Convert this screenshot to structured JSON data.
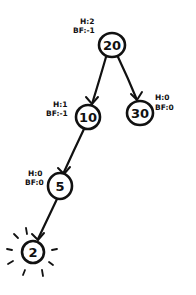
{
  "diagram": {
    "type": "avl-tree",
    "nodes": [
      {
        "id": "n20",
        "value": "20",
        "height_label": "H:2",
        "bf_label": "BF:-1"
      },
      {
        "id": "n10",
        "value": "10",
        "height_label": "H:1",
        "bf_label": "BF:-1"
      },
      {
        "id": "n30",
        "value": "30",
        "height_label": "H:0",
        "bf_label": "BF:0"
      },
      {
        "id": "n5",
        "value": "5",
        "height_label": "H:0",
        "bf_label": "BF:0"
      },
      {
        "id": "n2",
        "value": "2",
        "highlighted": true
      }
    ],
    "edges": [
      {
        "from": "20",
        "to": "10"
      },
      {
        "from": "20",
        "to": "30"
      },
      {
        "from": "10",
        "to": "5"
      },
      {
        "from": "5",
        "to": "2"
      }
    ]
  }
}
